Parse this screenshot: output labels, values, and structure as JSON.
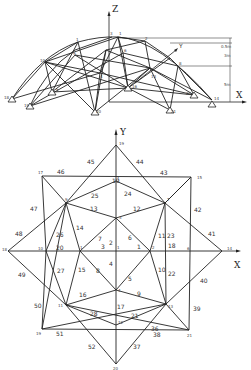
{
  "elevation": {
    "axes": {
      "z": "Z",
      "x": "X",
      "y": "Y"
    },
    "node_labels": [
      "3",
      "1",
      "1",
      "2",
      "10",
      "6",
      "4",
      "9",
      "7",
      "8",
      "16",
      "22",
      "13",
      "18",
      "19",
      "20",
      "21",
      "14"
    ],
    "dimensions": [
      "0.5m",
      "3m",
      "5m"
    ]
  },
  "plan": {
    "axes": {
      "x": "X",
      "y": "Y"
    },
    "node_labels": {
      "n19_top": "19",
      "n17": "17",
      "n15": "15",
      "n9": "9",
      "n7": "7",
      "n1_top": "1",
      "n3": "3",
      "n1_left": "1",
      "n1_center": "1",
      "n2": "2",
      "n18": "18",
      "n10": "10",
      "n14": "14",
      "n6": "6",
      "n4": "4",
      "n11": "11",
      "n13": "13",
      "n12": "12",
      "n19_bottom": "19",
      "n21": "21",
      "n20": "20"
    },
    "member_labels": [
      "1",
      "2",
      "3",
      "4",
      "5",
      "6",
      "7",
      "8",
      "9",
      "10",
      "11",
      "12",
      "13",
      "14",
      "15",
      "16",
      "17",
      "18",
      "19",
      "20",
      "21",
      "22",
      "23",
      "24",
      "25",
      "26",
      "27",
      "28",
      "36",
      "37",
      "38",
      "39",
      "40",
      "41",
      "42",
      "43",
      "44",
      "45",
      "46",
      "47",
      "48",
      "49",
      "50",
      "51",
      "52"
    ]
  }
}
